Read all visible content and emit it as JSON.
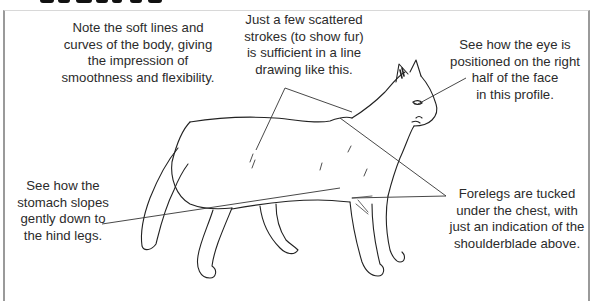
{
  "page": {
    "title_visible": false
  },
  "annotations": {
    "soft_lines": {
      "lines": [
        "Note the soft lines and",
        "curves of the body, giving",
        "the impression of",
        "smoothness and flexibility."
      ]
    },
    "fur_strokes": {
      "lines": [
        "Just a few scattered",
        "strokes (to show fur)",
        "is sufficient in a line",
        "drawing like this."
      ]
    },
    "eye_position": {
      "lines": [
        "See how the eye is",
        "positioned on the right",
        "half of the face",
        "in this profile."
      ]
    },
    "stomach": {
      "lines": [
        "See how the",
        "stomach slopes",
        "gently down to",
        "the hind legs."
      ]
    },
    "forelegs": {
      "lines": [
        "Forelegs are tucked",
        "under the chest, with",
        "just an indication of the",
        "shoulderblade above."
      ]
    }
  },
  "illustration": {
    "subject": "cat-line-drawing-profile",
    "colors": {
      "line": "#222222",
      "leader": "#333333",
      "background": "#ffffff",
      "frame": "#9a9a9a"
    }
  }
}
